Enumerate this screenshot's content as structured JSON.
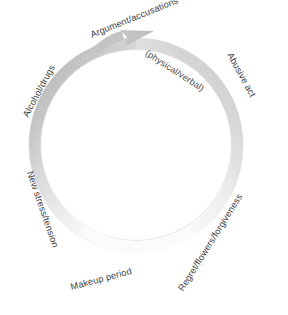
{
  "diagram": {
    "type": "cycle",
    "background_color": "#ffffff",
    "ring": {
      "center_x": 136,
      "center_y": 145,
      "outer_radius": 107,
      "inner_radius": 95,
      "gradient_dark": "#b9b9b9",
      "gradient_mid": "#d8d8d8",
      "gradient_light": "#f2f2f2",
      "outline_color": "#d5d5d5",
      "direction": "clockwise"
    },
    "arrow": {
      "name": "clockwise-arrow-head",
      "color": "#bdbdbd",
      "tip_x": 152,
      "tip_y": 31
    },
    "labels": [
      {
        "id": "argument-accusations",
        "text": "Argument/accusations",
        "x": 91,
        "y": 31,
        "rotation": -22,
        "variant": "main"
      },
      {
        "id": "physical-verbal",
        "text": "(physical/verbal)",
        "x": 146,
        "y": 48,
        "rotation": 33,
        "variant": "sub"
      },
      {
        "id": "abusive-act",
        "text": "Abusive act",
        "x": 229,
        "y": 49,
        "rotation": 61,
        "variant": "main"
      },
      {
        "id": "regret-flowers-forgiveness",
        "text": "Regret/flowers/forgiveness",
        "x": 181,
        "y": 286,
        "rotation": -58,
        "variant": "main"
      },
      {
        "id": "makeup-period",
        "text": "Makeup period",
        "x": 71,
        "y": 283,
        "rotation": -15,
        "variant": "main"
      },
      {
        "id": "new-stress-tension",
        "text": "New stress/tension",
        "x": 29,
        "y": 167,
        "rotation": 71,
        "variant": "main"
      },
      {
        "id": "alcohol-drugs",
        "text": "Alcohol/drugs",
        "x": 26,
        "y": 112,
        "rotation": -62,
        "variant": "main"
      }
    ]
  }
}
